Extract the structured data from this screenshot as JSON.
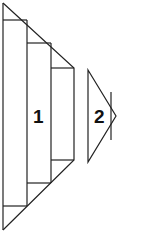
{
  "diagram": {
    "stroke_color": "#222222",
    "background": "#ffffff",
    "shapes": [
      {
        "id": "shape-1",
        "label": "1"
      },
      {
        "id": "shape-2",
        "label": "2"
      }
    ]
  }
}
